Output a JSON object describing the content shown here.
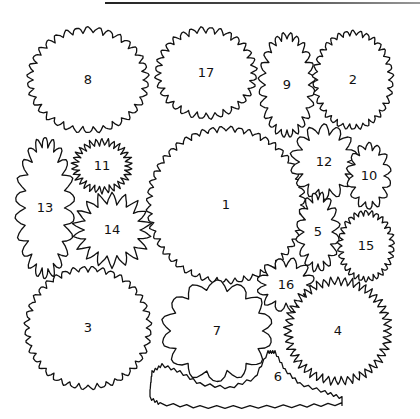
{
  "plants": [
    {
      "id": "8",
      "cx": 88,
      "cy": 80,
      "rx": 58,
      "ry": 50,
      "amp": 3,
      "n": 34,
      "style": "scallop"
    },
    {
      "id": "17",
      "cx": 206,
      "cy": 73,
      "rx": 48,
      "ry": 43,
      "amp": 3,
      "n": 32,
      "style": "scallop"
    },
    {
      "id": "9",
      "cx": 287,
      "cy": 85,
      "rx": 25,
      "ry": 49,
      "amp": 3.5,
      "n": 24,
      "style": "scallop"
    },
    {
      "id": "2",
      "cx": 353,
      "cy": 80,
      "rx": 38,
      "ry": 47,
      "amp": 2.5,
      "n": 34,
      "style": "scallop"
    },
    {
      "id": "13",
      "cx": 45,
      "cy": 208,
      "rx": 25,
      "ry": 66,
      "amp": 5,
      "n": 22,
      "style": "lobe"
    },
    {
      "id": "11",
      "cx": 102,
      "cy": 166,
      "rx": 27,
      "ry": 24,
      "amp": 3.5,
      "n": 30,
      "style": "spiky"
    },
    {
      "id": "14",
      "cx": 112,
      "cy": 230,
      "rx": 34,
      "ry": 32,
      "amp": 6,
      "n": 18,
      "style": "spiky"
    },
    {
      "id": "1",
      "cx": 226,
      "cy": 205,
      "rx": 77,
      "ry": 76,
      "amp": 2.5,
      "n": 52,
      "style": "scallop"
    },
    {
      "id": "12",
      "cx": 324,
      "cy": 162,
      "rx": 29,
      "ry": 33,
      "amp": 5,
      "n": 14,
      "style": "lobe"
    },
    {
      "id": "10",
      "cx": 369,
      "cy": 176,
      "rx": 19,
      "ry": 30,
      "amp": 3.5,
      "n": 14,
      "style": "lobe"
    },
    {
      "id": "5",
      "cx": 318,
      "cy": 232,
      "rx": 18,
      "ry": 36,
      "amp": 4,
      "n": 16,
      "style": "lobe"
    },
    {
      "id": "15",
      "cx": 366,
      "cy": 246,
      "rx": 26,
      "ry": 33,
      "amp": 2.5,
      "n": 30,
      "style": "scallop"
    },
    {
      "id": "16",
      "cx": 286,
      "cy": 285,
      "rx": 25,
      "ry": 23,
      "amp": 4.5,
      "n": 12,
      "style": "lobe"
    },
    {
      "id": "3",
      "cx": 88,
      "cy": 328,
      "rx": 61,
      "ry": 59,
      "amp": 2.5,
      "n": 40,
      "style": "scallop"
    },
    {
      "id": "7",
      "cx": 217,
      "cy": 331,
      "rx": 51,
      "ry": 46,
      "amp": 5,
      "n": 14,
      "style": "lobe"
    },
    {
      "id": "4",
      "cx": 338,
      "cy": 331,
      "rx": 50,
      "ry": 50,
      "amp": 4,
      "n": 46,
      "style": "spiky"
    }
  ],
  "bed6": {
    "id": "6",
    "label_x": 278,
    "label_y": 377
  },
  "colors": {
    "stroke": "#111111",
    "fill": "#ffffff"
  }
}
